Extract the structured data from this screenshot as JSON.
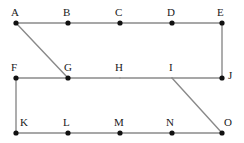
{
  "diagram": {
    "width": 244,
    "height": 143,
    "background_color": "#ffffff",
    "edge_color": "#8a8a8a",
    "vertex_color": "#111111",
    "label_color": "#1a1a1a",
    "edge_width": 1.4,
    "vertex_radius": 2.6,
    "vertices": [
      {
        "id": "A",
        "label": "A",
        "x": 16,
        "y": 23,
        "dot": true,
        "label_x": 11,
        "label_y": 7
      },
      {
        "id": "B",
        "label": "B",
        "x": 68,
        "y": 23,
        "dot": true,
        "label_x": 63,
        "label_y": 7
      },
      {
        "id": "C",
        "label": "C",
        "x": 120,
        "y": 23,
        "dot": true,
        "label_x": 115,
        "label_y": 7
      },
      {
        "id": "D",
        "label": "D",
        "x": 172,
        "y": 23,
        "dot": true,
        "label_x": 167,
        "label_y": 7
      },
      {
        "id": "E",
        "label": "E",
        "x": 222,
        "y": 23,
        "dot": true,
        "label_x": 217,
        "label_y": 7
      },
      {
        "id": "F",
        "label": "F",
        "x": 16,
        "y": 78,
        "dot": true,
        "label_x": 11,
        "label_y": 62
      },
      {
        "id": "G",
        "label": "G",
        "x": 68,
        "y": 78,
        "dot": true,
        "label_x": 64,
        "label_y": 62
      },
      {
        "id": "H",
        "label": "H",
        "x": 120,
        "y": 78,
        "dot": false,
        "label_x": 115,
        "label_y": 62
      },
      {
        "id": "I",
        "label": "I",
        "x": 172,
        "y": 78,
        "dot": false,
        "label_x": 169,
        "label_y": 62
      },
      {
        "id": "J",
        "label": "J",
        "x": 222,
        "y": 78,
        "dot": true,
        "label_x": 228,
        "label_y": 70
      },
      {
        "id": "K",
        "label": "K",
        "x": 16,
        "y": 133,
        "dot": true,
        "label_x": 20,
        "label_y": 117
      },
      {
        "id": "L",
        "label": "L",
        "x": 68,
        "y": 133,
        "dot": true,
        "label_x": 63,
        "label_y": 117
      },
      {
        "id": "M",
        "label": "M",
        "x": 120,
        "y": 133,
        "dot": true,
        "label_x": 114,
        "label_y": 117
      },
      {
        "id": "N",
        "label": "N",
        "x": 172,
        "y": 133,
        "dot": true,
        "label_x": 166,
        "label_y": 117
      },
      {
        "id": "O",
        "label": "O",
        "x": 222,
        "y": 133,
        "dot": true,
        "label_x": 224,
        "label_y": 117
      }
    ],
    "edges": [
      {
        "id": "A-B",
        "from": "A",
        "to": "B",
        "kind": "horizontal"
      },
      {
        "id": "B-C",
        "from": "B",
        "to": "C",
        "kind": "horizontal"
      },
      {
        "id": "C-D",
        "from": "C",
        "to": "D",
        "kind": "horizontal"
      },
      {
        "id": "D-E",
        "from": "D",
        "to": "E",
        "kind": "horizontal"
      },
      {
        "id": "E-J",
        "from": "E",
        "to": "J",
        "kind": "vertical"
      },
      {
        "id": "A-G",
        "from": "A",
        "to": "G",
        "kind": "diagonal"
      },
      {
        "id": "F-G",
        "from": "F",
        "to": "G",
        "kind": "horizontal"
      },
      {
        "id": "G-H",
        "from": "G",
        "to": "H",
        "kind": "horizontal"
      },
      {
        "id": "H-I",
        "from": "H",
        "to": "I",
        "kind": "horizontal"
      },
      {
        "id": "I-J",
        "from": "I",
        "to": "J",
        "kind": "horizontal"
      },
      {
        "id": "F-K",
        "from": "F",
        "to": "K",
        "kind": "vertical"
      },
      {
        "id": "I-O",
        "from": "I",
        "to": "O",
        "kind": "diagonal"
      },
      {
        "id": "K-L",
        "from": "K",
        "to": "L",
        "kind": "horizontal"
      },
      {
        "id": "L-M",
        "from": "L",
        "to": "M",
        "kind": "horizontal"
      },
      {
        "id": "M-N",
        "from": "M",
        "to": "N",
        "kind": "horizontal"
      },
      {
        "id": "N-O",
        "from": "N",
        "to": "O",
        "kind": "horizontal"
      }
    ]
  }
}
